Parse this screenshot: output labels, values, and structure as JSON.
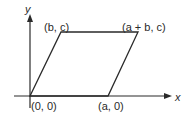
{
  "diagram": {
    "type": "parallelogram-on-axes",
    "axes": {
      "x_label": "x",
      "y_label": "y"
    },
    "vertices": [
      {
        "id": "origin",
        "label": "(0, 0)"
      },
      {
        "id": "a0",
        "label": "(a, 0)"
      },
      {
        "id": "bc",
        "label": "(b, c)"
      },
      {
        "id": "abc",
        "label": "(a + b, c)"
      }
    ],
    "colors": {
      "stroke": "#2a2a2a",
      "background": "#ffffff"
    }
  }
}
